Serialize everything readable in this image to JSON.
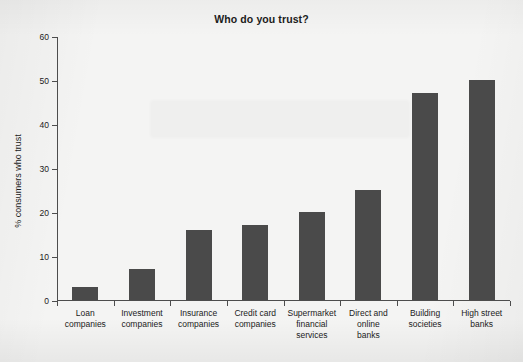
{
  "chart_data": {
    "type": "bar",
    "title": "Who do you trust?",
    "xlabel": "",
    "ylabel": "% consumers who trust",
    "ylim": [
      0,
      60
    ],
    "yticks": [
      0,
      10,
      20,
      30,
      40,
      50,
      60
    ],
    "grid": false,
    "legend": null,
    "categories": [
      "Loan companies",
      "Investment companies",
      "Insurance companies",
      "Credit card companies",
      "Supermarket financial services",
      "Direct and online banks",
      "Building societies",
      "High street banks"
    ],
    "category_lines": [
      [
        "Loan",
        "companies"
      ],
      [
        "Investment",
        "companies"
      ],
      [
        "Insurance",
        "companies"
      ],
      [
        "Credit card",
        "companies"
      ],
      [
        "Supermarket",
        "financial",
        "services"
      ],
      [
        "Direct and",
        "online",
        "banks"
      ],
      [
        "Building",
        "societies"
      ],
      [
        "High street",
        "banks"
      ]
    ],
    "values": [
      3,
      7,
      16,
      17,
      20,
      25,
      47,
      50
    ]
  },
  "style": {
    "bar_color": "#4a4a4a",
    "axis_color": "#4d4d4d",
    "text_color": "#1b1b1b",
    "background_color": "#f4f4f3"
  }
}
